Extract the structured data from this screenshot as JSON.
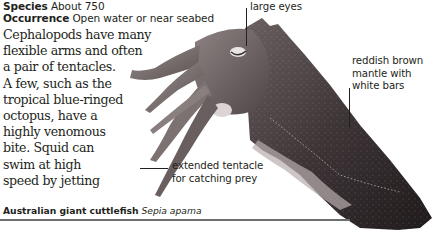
{
  "meta": {
    "species_label": "Species",
    "species_value": "About 750",
    "occurrence_label": "Occurrence",
    "occurrence_value": "Open water or near seabed"
  },
  "body_text": {
    "lines": [
      "Cephalopods have many",
      "flexible arms and often",
      "a pair of tentacles.",
      "A few, such as the",
      "tropical blue-ringed",
      "octopus, have a",
      "highly venomous",
      "bite. Squid can",
      "swim at high",
      "speed by jetting"
    ]
  },
  "annotations": {
    "eyes": {
      "lines": [
        "large eyes"
      ]
    },
    "mantle": {
      "lines": [
        "reddish brown",
        "mantle with",
        "white bars"
      ]
    },
    "tentacle": {
      "lines": [
        "extended tentacle",
        "for catching prey"
      ]
    }
  },
  "caption": {
    "common_name": "Australian giant cuttlefish",
    "scientific_name": "Sepia apama"
  },
  "image": {
    "subject": "cuttlefish-photo",
    "colors": {
      "body_dark": "#2b2426",
      "body_mid": "#6a5e5f",
      "body_light": "#a89c9c",
      "rule": "#6d6e70"
    }
  }
}
